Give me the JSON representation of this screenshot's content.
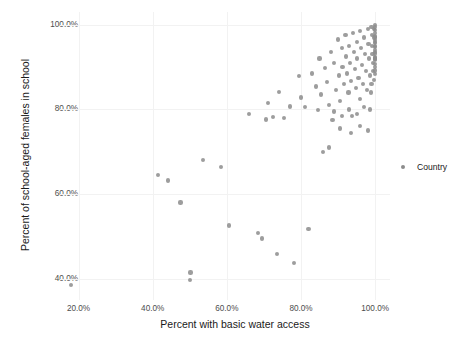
{
  "chart_data": {
    "type": "scatter",
    "title": "",
    "xlabel": "Percent with basic water access",
    "ylabel": "Percent of school-aged females in school",
    "xlim": [
      15,
      104
    ],
    "ylim": [
      35,
      103
    ],
    "xticks": [
      "20.0%",
      "40.0%",
      "60.0%",
      "80.0%",
      "100.0%"
    ],
    "xtick_values": [
      20,
      40,
      60,
      80,
      100
    ],
    "yticks": [
      "40.0%",
      "60.0%",
      "80.0%",
      "100.0%"
    ],
    "ytick_values": [
      40,
      60,
      80,
      100
    ],
    "grid": true,
    "legend": {
      "position": "right",
      "title": "",
      "entries": [
        {
          "label": "Country",
          "color": "#8c8c8c",
          "marker": "circle"
        }
      ]
    },
    "series": [
      {
        "name": "Country",
        "color": "#8c8c8c",
        "points": [
          [
            18.0,
            38.6
          ],
          [
            41.5,
            64.5
          ],
          [
            44.2,
            63.2
          ],
          [
            47.5,
            58.0
          ],
          [
            50.2,
            41.5
          ],
          [
            50.0,
            39.8
          ],
          [
            53.5,
            68.0
          ],
          [
            58.5,
            66.4
          ],
          [
            60.5,
            52.6
          ],
          [
            66.0,
            79.0
          ],
          [
            68.5,
            50.8
          ],
          [
            69.5,
            49.5
          ],
          [
            70.5,
            77.6
          ],
          [
            71.0,
            81.5
          ],
          [
            72.5,
            78.2
          ],
          [
            73.5,
            45.8
          ],
          [
            74.0,
            84.2
          ],
          [
            75.5,
            78.0
          ],
          [
            77.0,
            80.7
          ],
          [
            78.0,
            43.8
          ],
          [
            79.5,
            87.8
          ],
          [
            80.0,
            82.8
          ],
          [
            81.0,
            80.5
          ],
          [
            82.0,
            51.8
          ],
          [
            83.0,
            88.5
          ],
          [
            84.0,
            85.4
          ],
          [
            84.5,
            79.8
          ],
          [
            85.0,
            92.0
          ],
          [
            85.5,
            83.5
          ],
          [
            86.0,
            70.0
          ],
          [
            86.5,
            89.8
          ],
          [
            87.0,
            86.5
          ],
          [
            87.5,
            81.0
          ],
          [
            88.0,
            93.5
          ],
          [
            88.5,
            77.5
          ],
          [
            89.0,
            91.0
          ],
          [
            89.5,
            84.5
          ],
          [
            90.0,
            96.5
          ],
          [
            90.2,
            88.0
          ],
          [
            90.5,
            82.0
          ],
          [
            91.0,
            94.5
          ],
          [
            91.2,
            90.0
          ],
          [
            91.5,
            86.0
          ],
          [
            92.0,
            97.5
          ],
          [
            92.2,
            92.5
          ],
          [
            92.5,
            88.5
          ],
          [
            92.8,
            84.0
          ],
          [
            93.0,
            95.0
          ],
          [
            93.2,
            91.0
          ],
          [
            93.5,
            86.8
          ],
          [
            93.8,
            78.5
          ],
          [
            94.0,
            98.0
          ],
          [
            94.2,
            93.5
          ],
          [
            94.5,
            89.5
          ],
          [
            94.8,
            85.0
          ],
          [
            95.0,
            96.0
          ],
          [
            95.2,
            92.0
          ],
          [
            95.5,
            87.5
          ],
          [
            95.8,
            82.5
          ],
          [
            96.0,
            98.5
          ],
          [
            96.2,
            94.5
          ],
          [
            96.5,
            90.5
          ],
          [
            96.8,
            86.0
          ],
          [
            97.0,
            97.0
          ],
          [
            97.2,
            93.0
          ],
          [
            97.5,
            89.0
          ],
          [
            97.8,
            84.5
          ],
          [
            98.0,
            99.0
          ],
          [
            98.2,
            95.5
          ],
          [
            98.4,
            92.0
          ],
          [
            98.6,
            88.0
          ],
          [
            98.8,
            84.0
          ],
          [
            99.0,
            99.5
          ],
          [
            99.1,
            97.5
          ],
          [
            99.2,
            95.0
          ],
          [
            99.3,
            93.0
          ],
          [
            99.4,
            91.0
          ],
          [
            99.5,
            89.0
          ],
          [
            99.6,
            87.0
          ],
          [
            99.7,
            99.0
          ],
          [
            99.8,
            97.0
          ],
          [
            99.85,
            95.0
          ],
          [
            99.9,
            93.5
          ],
          [
            99.95,
            92.0
          ],
          [
            100.0,
            100.0
          ],
          [
            100.0,
            98.8
          ],
          [
            100.0,
            98.0
          ],
          [
            100.0,
            97.2
          ],
          [
            100.0,
            96.4
          ],
          [
            100.0,
            95.6
          ],
          [
            100.0,
            94.8
          ],
          [
            100.0,
            94.0
          ],
          [
            100.0,
            93.2
          ],
          [
            100.0,
            92.4
          ],
          [
            100.0,
            91.6
          ],
          [
            100.0,
            90.8
          ],
          [
            100.0,
            90.0
          ],
          [
            100.0,
            89.2
          ],
          [
            100.0,
            88.4
          ],
          [
            100.0,
            99.4
          ],
          [
            100.0,
            96.0
          ],
          [
            100.0,
            92.0
          ],
          [
            99.0,
            86.0
          ],
          [
            98.5,
            80.0
          ],
          [
            97.0,
            80.5
          ],
          [
            95.0,
            79.0
          ],
          [
            93.0,
            80.0
          ],
          [
            91.0,
            78.5
          ],
          [
            89.0,
            79.5
          ],
          [
            87.5,
            71.0
          ],
          [
            90.5,
            75.5
          ],
          [
            93.5,
            74.5
          ],
          [
            96.0,
            76.0
          ],
          [
            98.0,
            75.0
          ]
        ]
      }
    ]
  }
}
